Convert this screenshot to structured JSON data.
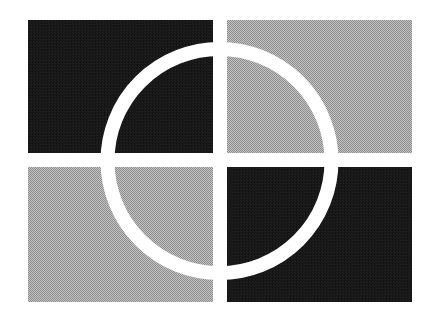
{
  "canvas": {
    "width": 439,
    "height": 320,
    "background_color": "#ffffff"
  },
  "artwork": {
    "name": "quadrant-circle-logo",
    "description": "Abstract logo mark: four rectangular quadrant tiles separated by a white cross gap, overlaid by a white ring (open circle) centered on the crossing point",
    "colors": {
      "dark": "#1b1b1b",
      "gray": "#a9a9a9",
      "white": "#ffffff"
    },
    "grid": {
      "left": 28,
      "right": 412,
      "top": 20,
      "bottom": 302,
      "gap_x_start": 213,
      "gap_x_end": 227,
      "gap_y_start": 153,
      "gap_y_end": 167
    },
    "quadrants": [
      {
        "name": "top-left",
        "fill": "#1b1b1b",
        "x": 28,
        "y": 20,
        "width": 185,
        "height": 133
      },
      {
        "name": "top-right",
        "fill": "#a9a9a9",
        "x": 227,
        "y": 20,
        "width": 185,
        "height": 133
      },
      {
        "name": "bottom-left",
        "fill": "#a9a9a9",
        "x": 28,
        "y": 167,
        "width": 185,
        "height": 135
      },
      {
        "name": "bottom-right",
        "fill": "#1b1b1b",
        "x": 227,
        "y": 167,
        "width": 185,
        "height": 135
      }
    ],
    "ring": {
      "name": "circle-ring",
      "stroke": "#ffffff",
      "center_x": 219.5,
      "center_y": 161,
      "radius": 112,
      "stroke_width": 14
    }
  }
}
